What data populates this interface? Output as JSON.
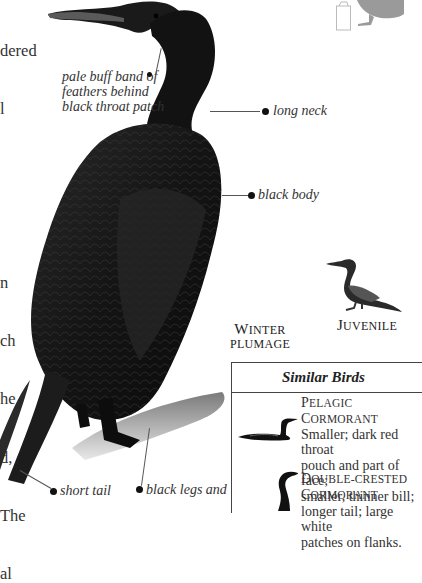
{
  "body_text_fragment": {
    "lines": [
      "dered",
      "l",
      "",
      "",
      "n",
      "ch",
      "he",
      "d,",
      "The",
      "al"
    ]
  },
  "illustration": {
    "subject": "Brandt's Cormorant (winter plumage) perched on rock",
    "callouts": {
      "throat": [
        "pale buff band of",
        "feathers behind",
        "black throat patch"
      ],
      "neck": "long neck",
      "body": "black body",
      "tail": "short tail",
      "legs": "black legs and"
    },
    "captions": {
      "main": {
        "line1_cap": "W",
        "line1_rest": "INTER",
        "line2": "PLUMAGE"
      },
      "juvenile": {
        "cap": "J",
        "rest": "UVENILE"
      }
    },
    "icons": [
      "habitat-silhouette-icon",
      "field-notebook-icon"
    ]
  },
  "similar_birds": {
    "title": "Similar Birds",
    "entries": [
      {
        "name_cap1": "P",
        "name_rest1": "ELAGIC ",
        "name_cap2": "C",
        "name_rest2": "ORMORANT",
        "description": [
          "Smaller; dark red throat",
          "pouch and part of face;",
          "smaller, thinner bill;",
          "longer tail; large white",
          "patches on flanks."
        ]
      },
      {
        "name_cap1": "D",
        "name_rest1": "OUBLE-CRESTED",
        "name_cap2": "C",
        "name_rest2": "ORMORANT",
        "description": []
      }
    ]
  },
  "colors": {
    "text": "#333333",
    "border": "#444444",
    "silhouette": "#9a9a9a"
  }
}
